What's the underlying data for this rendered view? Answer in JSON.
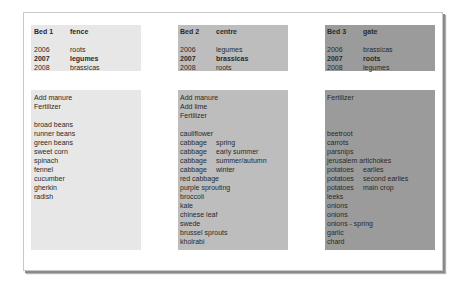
{
  "beds": [
    {
      "name": "Bed 1",
      "location": "fence",
      "color": "#e7e7e7",
      "rotation": [
        {
          "year": "2006",
          "crop": "roots",
          "current": false
        },
        {
          "year": "2007",
          "crop": "legumes",
          "current": true
        },
        {
          "year": "2008",
          "crop": "brassicas",
          "current": false
        }
      ],
      "preparation": [
        "Add manure",
        "Fertilizer"
      ],
      "plants": [
        {
          "name": "broad beans",
          "variety": ""
        },
        {
          "name": "runner beans",
          "variety": ""
        },
        {
          "name": "green beans",
          "variety": ""
        },
        {
          "name": "sweet corn",
          "variety": ""
        },
        {
          "name": "spinach",
          "variety": ""
        },
        {
          "name": "fennel",
          "variety": ""
        },
        {
          "name": "cucumber",
          "variety": ""
        },
        {
          "name": "gherkin",
          "variety": ""
        },
        {
          "name": "radish",
          "variety": ""
        }
      ]
    },
    {
      "name": "Bed 2",
      "location": "centre",
      "color": "#bdbdbd",
      "rotation": [
        {
          "year": "2006",
          "crop": "legumes",
          "current": false
        },
        {
          "year": "2007",
          "crop": "brassicas",
          "current": true
        },
        {
          "year": "2008",
          "crop": "roots",
          "current": false
        }
      ],
      "preparation": [
        "Add manure",
        "Add lime",
        "Fertilizer"
      ],
      "plants": [
        {
          "name": "cauliflower",
          "variety": ""
        },
        {
          "name": "cabbage",
          "variety": "spring"
        },
        {
          "name": "cabbage",
          "variety": "early summer"
        },
        {
          "name": "cabbage",
          "variety": "summer/autumn"
        },
        {
          "name": "cabbage",
          "variety": "winter"
        },
        {
          "name": "red cabbage",
          "variety": ""
        },
        {
          "name": "purple sprouting",
          "variety": ""
        },
        {
          "name": "broccoli",
          "variety": ""
        },
        {
          "name": "kale",
          "variety": ""
        },
        {
          "name": "chinese leaf",
          "variety": ""
        },
        {
          "name": "swede",
          "variety": ""
        },
        {
          "name": "brussel sprouts",
          "variety": ""
        },
        {
          "name": "kholrabi",
          "variety": ""
        }
      ]
    },
    {
      "name": "Bed 3",
      "location": "gate",
      "color": "#9b9b9b",
      "rotation": [
        {
          "year": "2006",
          "crop": "brassicas",
          "current": false
        },
        {
          "year": "2007",
          "crop": "roots",
          "current": true
        },
        {
          "year": "2008",
          "crop": "legumes",
          "current": false
        }
      ],
      "preparation": [
        "Fertilizer"
      ],
      "plants": [
        {
          "name": "beetroot",
          "variety": ""
        },
        {
          "name": "carrots",
          "variety": ""
        },
        {
          "name": "parsnips",
          "variety": ""
        },
        {
          "name": "jerusalem artichokes",
          "variety": ""
        },
        {
          "name": "potatoes",
          "variety": "earlies"
        },
        {
          "name": "potatoes",
          "variety": "second earlies"
        },
        {
          "name": "potatoes",
          "variety": "main crop"
        },
        {
          "name": "leeks",
          "variety": ""
        },
        {
          "name": "onions",
          "variety": ""
        },
        {
          "name": "onions",
          "variety": ""
        },
        {
          "name": "onions - spring",
          "variety": ""
        },
        {
          "name": "garlic",
          "variety": ""
        },
        {
          "name": "chard",
          "variety": ""
        }
      ]
    }
  ]
}
